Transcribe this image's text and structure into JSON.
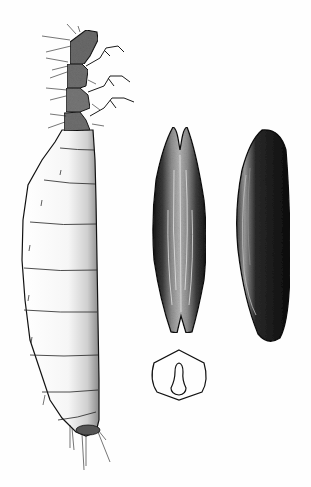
{
  "figure": {
    "panels": [
      {
        "name": "larva",
        "view": "lateral"
      },
      {
        "name": "pupa-ventral",
        "view": "ventral, split tips"
      },
      {
        "name": "pupa-lateral",
        "view": "lateral"
      },
      {
        "name": "pupa-cross-section",
        "view": "transverse section"
      }
    ],
    "colors": {
      "background": "#fefefe",
      "ink": "#111111",
      "stipple": "#2a2a2a"
    }
  }
}
